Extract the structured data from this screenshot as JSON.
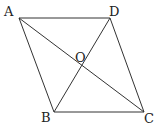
{
  "diagram": {
    "points": {
      "A": {
        "label": "A",
        "x": 19,
        "y": 18,
        "lx": 4,
        "ly": 16
      },
      "D": {
        "label": "D",
        "x": 110,
        "y": 18,
        "lx": 109,
        "ly": 16
      },
      "B": {
        "label": "B",
        "x": 54,
        "y": 112,
        "lx": 41,
        "ly": 122
      },
      "C": {
        "label": "C",
        "x": 144,
        "y": 112,
        "lx": 144,
        "ly": 123
      },
      "O": {
        "label": "O",
        "x": 82,
        "y": 66,
        "lx": 75,
        "ly": 62
      }
    },
    "segments": [
      "AD",
      "AB",
      "BC",
      "DC",
      "AC",
      "BD"
    ],
    "stroke_color": "#333333"
  }
}
